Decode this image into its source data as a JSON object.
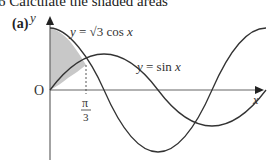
{
  "header": {
    "question_number": "6",
    "instruction": "Calculate the shaded areas",
    "part_label": "(a)"
  },
  "diagram": {
    "axes": {
      "x_label": "x",
      "y_label": "y",
      "origin_label": "O"
    },
    "tick_labels": [
      {
        "axis": "x",
        "numerator": "π",
        "denominator": "3"
      }
    ],
    "curves": [
      {
        "name": "y = √3 cos x",
        "label_prefix": "y = ",
        "label_root": "√3",
        "label_suffix": " cos x"
      },
      {
        "name": "y = sin x",
        "label": "y = sin x"
      }
    ],
    "shaded_region": "between y-axis, y = √3 cos x and y = sin x from 0 to π/3",
    "colors": {
      "shade": "#c8c8c8",
      "curve": "#333333",
      "axis": "#555555"
    }
  }
}
